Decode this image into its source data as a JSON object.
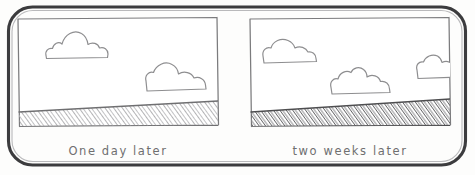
{
  "figure": {
    "medium": "pencil sketch",
    "frame": {
      "shape": "rounded-rectangle",
      "stroke_color": "#3c3c3e",
      "background_color": "#fdfdfc"
    }
  },
  "panels": [
    {
      "id": "left",
      "caption": "One  day  later",
      "caption_words": [
        "One",
        "day",
        "later"
      ],
      "sky": {
        "label": "sky",
        "fill_color": "#ffffff",
        "clouds": [
          {
            "name": "cloud-upper-left",
            "position": "upper-left",
            "clipped": false
          },
          {
            "name": "cloud-lower-right",
            "position": "lower-right",
            "clipped": false
          }
        ],
        "cloud_count": 2
      },
      "ground": {
        "label": "ground",
        "texture": "diagonal-hatching",
        "slope": "upward-to-the-right",
        "shade": "light",
        "stroke_color": "#8c8c8e"
      },
      "border_color": "#7b7b7d"
    },
    {
      "id": "right",
      "caption": "two  weeks  later",
      "caption_words": [
        "two",
        "weeks",
        "later"
      ],
      "sky": {
        "label": "sky",
        "fill_color": "#ffffff",
        "clouds": [
          {
            "name": "cloud-upper-left",
            "position": "upper-left",
            "clipped": false
          },
          {
            "name": "cloud-center",
            "position": "center",
            "clipped": false
          },
          {
            "name": "cloud-right-edge",
            "position": "right-edge",
            "clipped": true
          }
        ],
        "cloud_count": 3
      },
      "ground": {
        "label": "ground",
        "texture": "diagonal-hatching",
        "slope": "upward-to-the-right",
        "shade": "dark",
        "stroke_color": "#5e5e60"
      },
      "border_color": "#7b7b7d"
    }
  ],
  "colors": {
    "paper": "#fdfdfc",
    "frame_stroke": "#3c3c3e",
    "panel_stroke": "#7b7b7d",
    "cloud_stroke": "#909092",
    "ground_light": "#8c8c8e",
    "ground_dark": "#5e5e60",
    "caption_ink": "#6f6f70"
  }
}
